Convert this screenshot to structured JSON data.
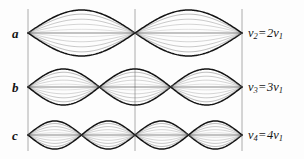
{
  "figure": {
    "background_color": "#fdfdfd",
    "ink_color": "#141414",
    "gridline_color": "#9a9a9a",
    "width": 304,
    "height": 159
  },
  "gridlines": {
    "orientation": "vertical",
    "x_positions": [
      28,
      135,
      242
    ],
    "y_top": 9,
    "y_bottom": 151,
    "color": "#a3a3a3",
    "count": 3
  },
  "rows": [
    {
      "letter": "a",
      "letter_x": 12,
      "letter_y": 27,
      "axis_y": 33,
      "harmonic": 2,
      "antinodes": 2,
      "amplitude": 23,
      "label": {
        "symbol": "v",
        "sub": "2",
        "equals": "=",
        "multiplier": "2",
        "symbol2": "v",
        "sub2": "1",
        "text": "v2 = 2v1",
        "x": 248,
        "y": 27
      }
    },
    {
      "letter": "b",
      "letter_x": 12,
      "letter_y": 81,
      "axis_y": 87,
      "harmonic": 3,
      "antinodes": 3,
      "amplitude": 18,
      "label": {
        "symbol": "v",
        "sub": "3",
        "equals": "=",
        "multiplier": "3",
        "symbol2": "v",
        "sub2": "1",
        "text": "v3 = 3v1",
        "x": 248,
        "y": 81
      }
    },
    {
      "letter": "c",
      "letter_x": 12,
      "letter_y": 129,
      "axis_y": 135,
      "harmonic": 4,
      "antinodes": 4,
      "amplitude": 14,
      "label": {
        "symbol": "v",
        "sub": "4",
        "equals": "=",
        "multiplier": "4",
        "symbol2": "v",
        "sub2": "1",
        "text": "v4 = 4v1",
        "x": 248,
        "y": 129
      }
    }
  ],
  "chart_data": {
    "type": "line",
    "xlabel": "",
    "ylabel": "",
    "x_start": 28,
    "x_end": 242,
    "string_length_units": 1,
    "grid": true,
    "legend_position": "right",
    "annotations": [
      "a",
      "b",
      "c",
      "v2 = 2v1",
      "v3 = 3v1",
      "v4 = 4v1"
    ],
    "trace_phase_fractions": [
      1,
      0.82,
      0.6,
      0.38,
      0.16,
      -0.16,
      -0.38,
      -0.6,
      -0.82,
      -1
    ],
    "series": [
      {
        "name": "a",
        "harmonic": 2,
        "frequency_label": "v2 = 2v1",
        "frequency_ratio": 2,
        "nodes": 3,
        "antinodes": 2,
        "peak_amplitude": 23,
        "baseline_y": 33
      },
      {
        "name": "b",
        "harmonic": 3,
        "frequency_label": "v3 = 3v1",
        "frequency_ratio": 3,
        "nodes": 4,
        "antinodes": 3,
        "peak_amplitude": 18,
        "baseline_y": 87
      },
      {
        "name": "c",
        "harmonic": 4,
        "frequency_label": "v4 = 4v1",
        "frequency_ratio": 4,
        "nodes": 5,
        "antinodes": 4,
        "peak_amplitude": 14,
        "baseline_y": 135
      }
    ]
  }
}
